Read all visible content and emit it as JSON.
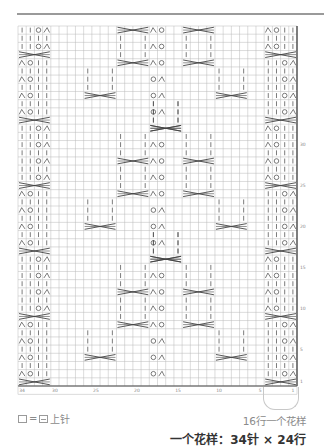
{
  "chart_data": {
    "type": "knitting-chart",
    "columns": 34,
    "rows": 44,
    "column_tick_labels": [
      "34",
      "30",
      "25",
      "20",
      "15",
      "10",
      "5",
      "1"
    ],
    "row_tick_labels": [
      "1",
      "5",
      "10",
      "15",
      "20",
      "25",
      "30"
    ],
    "symbols": {
      "purl": "|",
      "yarn_over": "O",
      "k2tog": "⋏",
      "cable": "X-cross"
    },
    "side_panel_motif": "2 yarn-over/decrease columns with 4-st cable every 8 rows",
    "center_motif": "diamond lattice of traveling cables with central eyelet column"
  },
  "legend": {
    "equals": "=",
    "label": "上针"
  },
  "notes": {
    "repeat_rows": "16行一个花样",
    "pattern_size": "一个花样：34针 × 24行"
  },
  "colors": {
    "grid": "#b8b8b8",
    "symbol": "#444444",
    "border": "#333333"
  }
}
